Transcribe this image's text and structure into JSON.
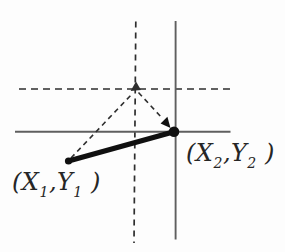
{
  "figure": {
    "background": "#fdfdfd",
    "colors": {
      "axis_solid": "#5f5f5f",
      "axis_dashed": "#2e2e2e",
      "segment": "#101010",
      "label": "#262626"
    },
    "point1": {
      "label": {
        "open": "(X",
        "sub_a": "1",
        "mid": ",Y",
        "sub_b": "1",
        "close": " )"
      }
    },
    "point2": {
      "label": {
        "open": "(X",
        "sub_a": "2",
        "mid": ",Y",
        "sub_b": "2",
        "close": " )"
      }
    }
  }
}
